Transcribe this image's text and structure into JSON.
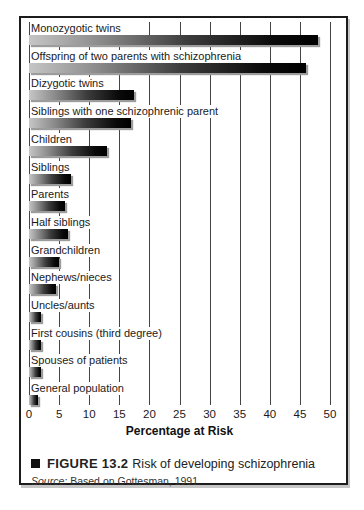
{
  "figure": {
    "caption_marker": "black-square",
    "caption_label": "FIGURE 13.2",
    "caption_text": "Risk of developing schizophrenia",
    "source_prefix": "Source:",
    "source_text": "Based on Gottesman, 1991."
  },
  "chart_data": {
    "type": "bar",
    "orientation": "horizontal",
    "title": "Risk of developing schizophrenia",
    "xlabel": "Percentage at Risk",
    "xlim": [
      0,
      50
    ],
    "xticks": [
      0,
      5,
      10,
      15,
      20,
      25,
      30,
      35,
      40,
      45,
      50
    ],
    "grid": true,
    "categories": [
      "Monozygotic twins",
      "Offspring of two parents with schizophrenia",
      "Dizygotic twins",
      "Siblings with one schizophrenic parent",
      "Children",
      "Siblings",
      "Parents",
      "Half siblings",
      "Grandchildren",
      "Nephews/nieces",
      "Uncles/aunts",
      "First cousins (third degree)",
      "Spouses of patients",
      "General population"
    ],
    "values": [
      48,
      46,
      17.5,
      17,
      13,
      7,
      6,
      6.5,
      5,
      4.5,
      2,
      2,
      2,
      1.5
    ],
    "bar_gradient": [
      "#c6c6c6",
      "#000000"
    ],
    "bar_shadow_color": "#9c9c9c",
    "gridline_color": "#454545"
  }
}
